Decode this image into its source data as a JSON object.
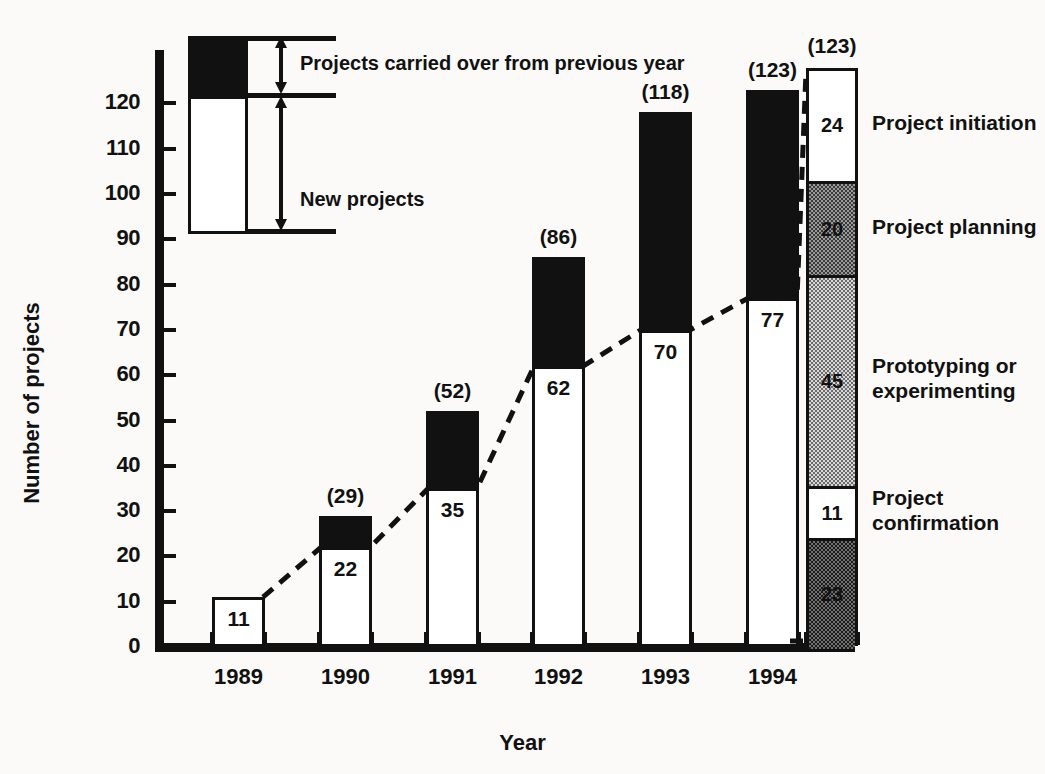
{
  "chart_data": {
    "type": "bar",
    "title": "",
    "xlabel": "Year",
    "ylabel": "Number of projects",
    "ylim": [
      0,
      130
    ],
    "ytick_labels": [
      "0",
      "10",
      "20",
      "30",
      "40",
      "50",
      "60",
      "70",
      "80",
      "90",
      "100",
      "110",
      "120"
    ],
    "ytick_values": [
      0,
      10,
      20,
      30,
      40,
      50,
      60,
      70,
      80,
      90,
      100,
      110,
      120
    ],
    "categories": [
      "1989",
      "1990",
      "1991",
      "1992",
      "1993",
      "1994"
    ],
    "grid": false,
    "legend_position": "inset-top-left",
    "series": [
      {
        "name": "New projects",
        "values": [
          11,
          22,
          35,
          62,
          70,
          77
        ],
        "labels": [
          "11",
          "22",
          "35",
          "62",
          "70",
          "77"
        ],
        "fill": "#ffffff"
      },
      {
        "name": "Projects carried over from previous year",
        "values": [
          0,
          7,
          17,
          24,
          48,
          46
        ],
        "fill": "#111111"
      }
    ],
    "totals": [
      11,
      29,
      52,
      86,
      118,
      123
    ],
    "total_labels": [
      "(11)",
      "(29)",
      "(52)",
      "(86)",
      "(118)",
      "(123)"
    ],
    "total_labels_shown": [
      "",
      "(29)",
      "(52)",
      "(86)",
      "(118)",
      "(123)"
    ],
    "annotations": {
      "trend_line": {
        "style": "dashed",
        "description": "dashed line connecting tops of new-project segments"
      }
    },
    "breakdown": {
      "title": "",
      "total": 123,
      "segments": [
        {
          "label": "Project initiation",
          "value": 24,
          "value_label": "24",
          "fill": "white"
        },
        {
          "label": "Project planning",
          "value": 20,
          "value_label": "20",
          "fill": "medium-stipple"
        },
        {
          "label": "Prototyping or\nexperimenting",
          "value": 45,
          "value_label": "45",
          "fill": "light-stipple"
        },
        {
          "label": "Project\nconfirmation",
          "value": 11,
          "value_label": "11",
          "fill": "white"
        },
        {
          "label": "",
          "value": 23,
          "value_label": "23",
          "fill": "dark-stipple"
        }
      ]
    }
  },
  "legend": {
    "carried_over": "Projects carried over from previous year",
    "new_projects": "New projects"
  },
  "axes": {
    "x_title": "Year",
    "y_title": "Number of projects"
  },
  "colors": {
    "ink": "#111111",
    "paper": "#fbfaf8",
    "carried_over": "#111111",
    "new_projects": "#ffffff"
  }
}
